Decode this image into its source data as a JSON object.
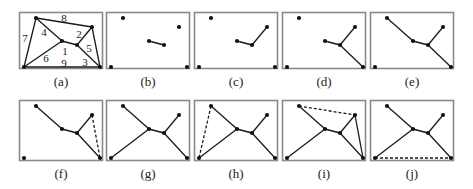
{
  "figure": {
    "colors": {
      "frame": "#8a8a8a",
      "edge": "#1a1a1a",
      "node": "#111111",
      "text": "#222222"
    },
    "nodes": {
      "TL": [
        17,
        6
      ],
      "TR": [
        73,
        15
      ],
      "BL": [
        5,
        55
      ],
      "BR": [
        81,
        55
      ],
      "C1": [
        43,
        29
      ],
      "C2": [
        58,
        33
      ]
    },
    "panels": [
      {
        "id": "a",
        "label": "(a)",
        "row": 0,
        "col": 0,
        "edges": [
          [
            "TL",
            "TR"
          ],
          [
            "TL",
            "BL"
          ],
          [
            "BL",
            "BR"
          ],
          [
            "TR",
            "BR"
          ],
          [
            "TL",
            "C1"
          ],
          [
            "C1",
            "C2"
          ],
          [
            "C2",
            "TR"
          ],
          [
            "C1",
            "BL"
          ],
          [
            "C2",
            "BR"
          ]
        ],
        "dashed": [],
        "edge_labels": [
          {
            "text": "8",
            "x": 45,
            "y": 6
          },
          {
            "text": "7",
            "x": 6,
            "y": 26
          },
          {
            "text": "4",
            "x": 25,
            "y": 20
          },
          {
            "text": "2",
            "x": 60,
            "y": 22
          },
          {
            "text": "1",
            "x": 46,
            "y": 39
          },
          {
            "text": "5",
            "x": 70,
            "y": 36
          },
          {
            "text": "6",
            "x": 27,
            "y": 46
          },
          {
            "text": "9",
            "x": 45,
            "y": 51
          },
          {
            "text": "3",
            "x": 66,
            "y": 50
          }
        ]
      },
      {
        "id": "b",
        "label": "(b)",
        "row": 0,
        "col": 1,
        "edges": [
          [
            "C1",
            "C2"
          ]
        ],
        "dashed": [],
        "edge_labels": []
      },
      {
        "id": "c",
        "label": "(c)",
        "row": 0,
        "col": 2,
        "edges": [
          [
            "C1",
            "C2"
          ],
          [
            "C2",
            "TR"
          ]
        ],
        "dashed": [],
        "edge_labels": []
      },
      {
        "id": "d",
        "label": "(d)",
        "row": 0,
        "col": 3,
        "edges": [
          [
            "C1",
            "C2"
          ],
          [
            "C2",
            "TR"
          ],
          [
            "C2",
            "BR"
          ]
        ],
        "dashed": [],
        "edge_labels": []
      },
      {
        "id": "e",
        "label": "(e)",
        "row": 0,
        "col": 4,
        "edges": [
          [
            "C1",
            "C2"
          ],
          [
            "C2",
            "TR"
          ],
          [
            "C2",
            "BR"
          ],
          [
            "TL",
            "C1"
          ]
        ],
        "dashed": [],
        "edge_labels": []
      },
      {
        "id": "f",
        "label": "(f)",
        "row": 1,
        "col": 0,
        "edges": [
          [
            "C1",
            "C2"
          ],
          [
            "C2",
            "TR"
          ],
          [
            "C2",
            "BR"
          ],
          [
            "TL",
            "C1"
          ]
        ],
        "dashed": [
          [
            "TR",
            "BR"
          ]
        ],
        "edge_labels": []
      },
      {
        "id": "g",
        "label": "(g)",
        "row": 1,
        "col": 1,
        "edges": [
          [
            "C1",
            "C2"
          ],
          [
            "C2",
            "TR"
          ],
          [
            "C2",
            "BR"
          ],
          [
            "TL",
            "C1"
          ],
          [
            "C1",
            "BL"
          ]
        ],
        "dashed": [],
        "edge_labels": []
      },
      {
        "id": "h",
        "label": "(h)",
        "row": 1,
        "col": 2,
        "edges": [
          [
            "C1",
            "C2"
          ],
          [
            "C2",
            "TR"
          ],
          [
            "C2",
            "BR"
          ],
          [
            "TL",
            "C1"
          ],
          [
            "C1",
            "BL"
          ]
        ],
        "dashed": [
          [
            "TL",
            "BL"
          ]
        ],
        "edge_labels": []
      },
      {
        "id": "i",
        "label": "(i)",
        "row": 1,
        "col": 3,
        "edges": [
          [
            "C1",
            "C2"
          ],
          [
            "C2",
            "TR"
          ],
          [
            "C2",
            "BR"
          ],
          [
            "TL",
            "C1"
          ],
          [
            "C1",
            "BL"
          ],
          [
            "TR",
            "BR"
          ]
        ],
        "dashed": [
          [
            "TL",
            "TR"
          ]
        ],
        "edge_labels": []
      },
      {
        "id": "j",
        "label": "(j)",
        "row": 1,
        "col": 4,
        "edges": [
          [
            "C1",
            "C2"
          ],
          [
            "C2",
            "TR"
          ],
          [
            "C2",
            "BR"
          ],
          [
            "TL",
            "C1"
          ],
          [
            "C1",
            "BL"
          ]
        ],
        "dashed": [
          [
            "BL",
            "BR"
          ]
        ],
        "edge_labels": []
      }
    ]
  }
}
